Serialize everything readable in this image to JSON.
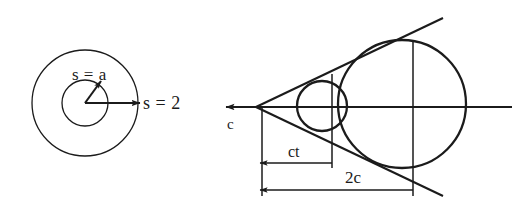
{
  "figure": {
    "background_color": "#ffffff",
    "stroke_color": "#1b1b1b",
    "width": 530,
    "height": 212
  },
  "left_diagram": {
    "name": "concentric-circles-diagram",
    "center": {
      "x": 85,
      "y": 103
    },
    "outer_circle": {
      "radius": 53
    },
    "inner_circle": {
      "radius": 23
    },
    "inner_radius_label": "s = a",
    "outer_radius_label": "s = 2",
    "arrows": [
      {
        "name": "inner-radius-arrow",
        "from": {
          "x": 85,
          "y": 103
        },
        "to": {
          "x": 100,
          "y": 82
        }
      },
      {
        "name": "outer-radius-arrow",
        "from": {
          "x": 85,
          "y": 103
        },
        "to": {
          "x": 139,
          "y": 103
        }
      }
    ]
  },
  "right_diagram": {
    "name": "cone-tangent-circles-diagram",
    "apex": {
      "x": 256,
      "y": 107
    },
    "axis": {
      "arrow_tip_x": 224,
      "right_end_x": 512,
      "y": 107
    },
    "small_circle": {
      "cx": 322,
      "cy": 106,
      "r": 25
    },
    "large_circle": {
      "cx": 402,
      "cy": 104,
      "r": 64
    },
    "velocity_label": "c",
    "dimensions": [
      {
        "name": "ct",
        "label": "ct",
        "line_y": 163,
        "from_x": 262,
        "to_x": 332
      },
      {
        "name": "2c",
        "label": "2c",
        "line_y": 190,
        "from_x": 262,
        "to_x": 413
      }
    ]
  }
}
